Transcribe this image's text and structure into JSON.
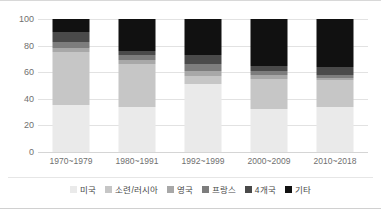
{
  "chart_data": {
    "type": "bar",
    "title": "",
    "subtitle": "",
    "xlabel": "",
    "ylabel": "",
    "stacked": true,
    "percent_stacked": true,
    "grid": true,
    "legend_position": "bottom",
    "ylim": [
      0,
      100
    ],
    "yticks": [
      0,
      20,
      40,
      60,
      80,
      100
    ],
    "ytick_labels": [
      "0",
      "20",
      "40",
      "60",
      "80",
      "100"
    ],
    "categories": [
      "1970~1979",
      "1980~1991",
      "1992~1999",
      "2000~2009",
      "2010~2018"
    ],
    "series": [
      {
        "name": "미국",
        "color": "#eaeaea",
        "values": [
          35,
          34,
          51,
          32,
          34
        ]
      },
      {
        "name": "소련/러시아",
        "color": "#c6c6c6",
        "values": [
          40,
          32,
          6,
          23,
          20
        ]
      },
      {
        "name": "영국",
        "color": "#a8a8a8",
        "values": [
          3,
          3,
          4,
          3,
          2
        ]
      },
      {
        "name": "프랑스",
        "color": "#7d7d7d",
        "values": [
          5,
          4,
          5,
          3,
          2
        ]
      },
      {
        "name": "4개국",
        "color": "#4a4a4a",
        "values": [
          7,
          3,
          7,
          4,
          6
        ]
      },
      {
        "name": "기타",
        "color": "#111111",
        "values": [
          10,
          24,
          27,
          35,
          36
        ]
      }
    ]
  },
  "axis": {
    "y_tick_labels": [
      "100",
      "80",
      "60",
      "40",
      "20",
      "0"
    ],
    "x_tick_labels": [
      "1970~1979",
      "1980~1991",
      "1992~1999",
      "2000~2009",
      "2010~2018"
    ]
  },
  "legend": {
    "items": [
      {
        "label": "미국"
      },
      {
        "label": "소련/러시아"
      },
      {
        "label": "영국"
      },
      {
        "label": "프랑스"
      },
      {
        "label": "4개국"
      },
      {
        "label": "기타"
      }
    ]
  },
  "colors": {
    "grid": "#e2e2e2",
    "axis_text": "#6f6f6f",
    "legend_text": "#4a4a4a",
    "background": "#ffffff",
    "border": "#d8d8d8"
  }
}
